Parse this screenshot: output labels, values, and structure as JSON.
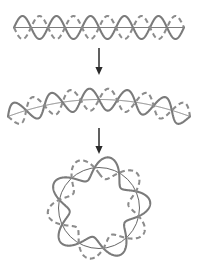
{
  "figure": {
    "background_color": "#ffffff",
    "width": 198,
    "height": 263,
    "colors": {
      "solid_wave": "#7b7b7b",
      "dashed_wave": "#8c8c8c",
      "axis": "#6e6e6e",
      "reference_circle": "#4a4a4a",
      "arrow": "#2b2b2b"
    },
    "panels": [
      {
        "name": "straight-standing-wave",
        "label": "",
        "description": "Straight horizontal string carrying a standing wave; solid curve and dashed curve are the two extreme displacement phases.",
        "wave_cycles": 5,
        "nodes": 11,
        "antinodes": 10,
        "axis_visible": true,
        "curvature": 0
      },
      {
        "name": "bent-standing-wave",
        "label": "",
        "description": "The same standing wave on a slightly bent (arched) string, beginning to curve toward a closed loop.",
        "wave_cycles": 5,
        "nodes": 11,
        "antinodes": 10,
        "axis_visible": true,
        "curvature": 0.18
      },
      {
        "name": "circular-standing-wave",
        "label": "",
        "description": "The standing wave closed on itself around a circular orbit; an integral number of wavelengths fits the circumference.",
        "wave_cycles": 5,
        "nodes": 5,
        "antinodes": 5,
        "reference_circle_visible": true,
        "curvature": 1
      }
    ],
    "arrows": [
      {
        "name": "arrow-top",
        "direction": "down",
        "from_panel": "straight-standing-wave",
        "to_panel": "bent-standing-wave"
      },
      {
        "name": "arrow-bottom",
        "direction": "down",
        "from_panel": "bent-standing-wave",
        "to_panel": "circular-standing-wave"
      }
    ]
  }
}
